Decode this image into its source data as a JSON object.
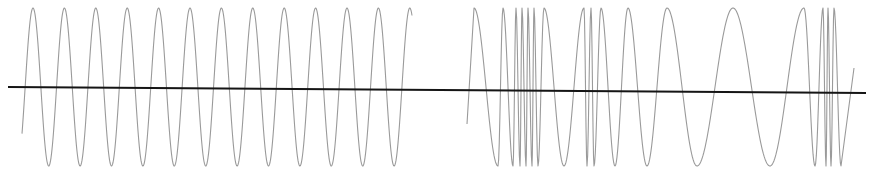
{
  "diagram": {
    "colors": {
      "background": "#ffffff",
      "wave": "#9a9a9a",
      "baseline": "#151515"
    },
    "baseline": {
      "x1": 8,
      "y1": 87,
      "x2": 866,
      "y2": 93
    },
    "amplitude": {
      "top_y": 8,
      "bottom_y": 166
    },
    "left_wave": {
      "type": "sine",
      "start": [
        22,
        116
      ],
      "end_x": 412,
      "first_peak_x": 33,
      "period_px": 31.4,
      "cycles_visible": 12.5
    },
    "right_wave": {
      "type": "irregular",
      "start": [
        467,
        124
      ],
      "turning_points": [
        [
          474,
          "top"
        ],
        [
          498,
          "bottom"
        ],
        [
          503,
          "top"
        ],
        [
          513,
          "bottom"
        ],
        [
          516,
          "top"
        ],
        [
          520,
          "bottom"
        ],
        [
          522,
          "top"
        ],
        [
          526,
          "bottom"
        ],
        [
          528,
          "top"
        ],
        [
          532,
          "bottom"
        ],
        [
          534,
          "top"
        ],
        [
          538,
          "bottom"
        ],
        [
          544,
          "top"
        ],
        [
          564,
          "bottom"
        ],
        [
          584,
          "top"
        ],
        [
          587,
          "bottom"
        ],
        [
          591,
          "top"
        ],
        [
          594,
          "bottom"
        ],
        [
          601,
          "top"
        ],
        [
          615,
          "bottom"
        ],
        [
          628,
          "top"
        ],
        [
          647,
          "bottom"
        ],
        [
          667,
          "top"
        ],
        [
          697,
          "bottom"
        ],
        [
          733,
          "top"
        ],
        [
          770,
          "bottom"
        ],
        [
          804,
          "top"
        ],
        [
          815,
          "bottom"
        ],
        [
          823,
          "top"
        ],
        [
          826,
          "bottom"
        ],
        [
          828,
          "top"
        ],
        [
          831,
          "bottom"
        ],
        [
          834,
          "top"
        ],
        [
          841,
          "bottom"
        ]
      ],
      "end": [
        854,
        68
      ]
    }
  }
}
